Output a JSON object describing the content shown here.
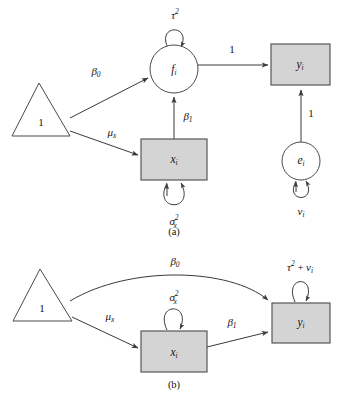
{
  "figure": {
    "kind": "path-diagram",
    "background": "#ffffff",
    "box_fill": "#d4d4d4",
    "stroke": "#3a3a3a",
    "panels": [
      {
        "id": "a",
        "caption": "(a)",
        "nodes": [
          {
            "id": "tri_a",
            "shape": "triangle",
            "label": "1"
          },
          {
            "id": "f_a",
            "shape": "circle",
            "label_base": "f",
            "label_sub": "i"
          },
          {
            "id": "x_a",
            "shape": "rect",
            "label_base": "x",
            "label_sub": "i"
          },
          {
            "id": "y_a",
            "shape": "rect",
            "label_base": "y",
            "label_sub": "i"
          },
          {
            "id": "e_a",
            "shape": "circle",
            "label_base": "e",
            "label_sub": "i"
          }
        ],
        "edges": [
          {
            "id": "tri_to_f",
            "from": "tri_a",
            "to": "f_a",
            "label_base": "β",
            "label_sub": "0"
          },
          {
            "id": "tri_to_x",
            "from": "tri_a",
            "to": "x_a",
            "label_base": "μ",
            "label_sub": "x"
          },
          {
            "id": "x_to_f",
            "from": "x_a",
            "to": "f_a",
            "label_base": "β",
            "label_sub": "1"
          },
          {
            "id": "f_to_y",
            "from": "f_a",
            "to": "y_a",
            "label": "1"
          },
          {
            "id": "e_to_y",
            "from": "e_a",
            "to": "y_a",
            "label": "1"
          }
        ],
        "loops": [
          {
            "id": "loop_f",
            "on": "f_a",
            "label_base": "τ",
            "label_sup": "2"
          },
          {
            "id": "loop_x",
            "on": "x_a",
            "label_base": "σ",
            "label_sup": "2",
            "label_sub": "x"
          },
          {
            "id": "loop_e",
            "on": "e_a",
            "label_base": "v",
            "label_sub": "i"
          }
        ]
      },
      {
        "id": "b",
        "caption": "(b)",
        "nodes": [
          {
            "id": "tri_b",
            "shape": "triangle",
            "label": "1"
          },
          {
            "id": "x_b",
            "shape": "rect",
            "label_base": "x",
            "label_sub": "i"
          },
          {
            "id": "y_b",
            "shape": "rect",
            "label_base": "y",
            "label_sub": "i"
          }
        ],
        "edges": [
          {
            "id": "tri_to_y_b",
            "from": "tri_b",
            "to": "y_b",
            "label_base": "β",
            "label_sub": "0",
            "curved": true
          },
          {
            "id": "tri_to_x_b",
            "from": "tri_b",
            "to": "x_b",
            "label_base": "μ",
            "label_sub": "x"
          },
          {
            "id": "x_to_y_b",
            "from": "x_b",
            "to": "y_b",
            "label_base": "β",
            "label_sub": "1"
          }
        ],
        "loops": [
          {
            "id": "loop_x_b",
            "on": "x_b",
            "label_base": "σ",
            "label_sup": "2",
            "label_sub": "x"
          },
          {
            "id": "loop_y_b",
            "on": "y_b",
            "label_base": "τ",
            "label_sup": "2",
            "label_plus": "+",
            "label_tail_base": "v",
            "label_tail_sub": "i"
          }
        ]
      }
    ],
    "text": {
      "one": "1",
      "tau": "τ",
      "sigma": "σ",
      "mu": "μ",
      "beta": "β",
      "x": "x",
      "y": "y",
      "f": "f",
      "e": "e",
      "v": "v",
      "i": "i",
      "zero": "0",
      "two": "2",
      "plus": "+",
      "caption_a": "(a)",
      "caption_b": "(b)"
    }
  }
}
